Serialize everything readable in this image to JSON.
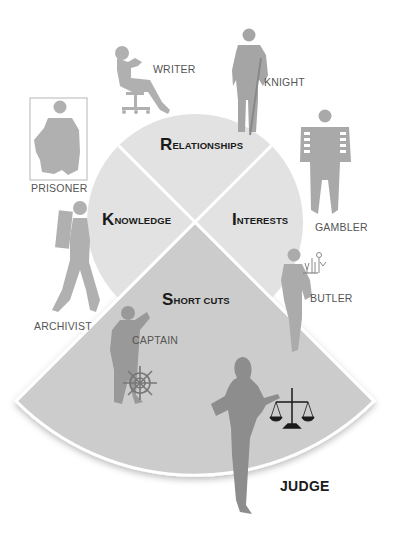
{
  "diagram": {
    "center": {
      "x": 195,
      "y": 222
    },
    "inner_radius": 108,
    "outer_radius": 253,
    "colors": {
      "inner_segment": "#e2e2e2",
      "outer_segment": "#cccccc",
      "divider": "#ffffff",
      "figure": "#a9a9a9",
      "figure_dark": "#8a8a8a",
      "label": "#555555",
      "segment_label": "#1a1a1a"
    },
    "segments": [
      {
        "id": "relationships",
        "initial": "R",
        "rest": "ELATIONSHIPS"
      },
      {
        "id": "knowledge",
        "initial": "K",
        "rest": "NOWLEDGE"
      },
      {
        "id": "interests",
        "initial": "I",
        "rest": "NTERESTS"
      },
      {
        "id": "shortcuts",
        "initial": "S",
        "rest": "HORT CUTS"
      }
    ],
    "roles": {
      "writer": "WRITER",
      "knight": "KNIGHT",
      "prisoner": "PRISONER",
      "gambler": "GAMBLER",
      "archivist": "ARCHIVIST",
      "butler": "BUTLER",
      "captain": "CAPTAIN",
      "judge": "JUDGE"
    }
  }
}
